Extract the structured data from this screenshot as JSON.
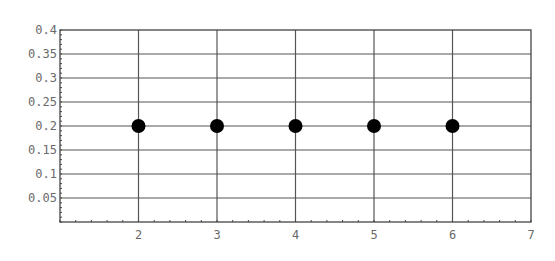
{
  "chart_data": {
    "type": "scatter",
    "title": "",
    "xlabel": "",
    "ylabel": "",
    "xlim": [
      1,
      7
    ],
    "ylim": [
      0,
      0.4
    ],
    "grid": true,
    "legend": null,
    "x_ticks": [
      2,
      3,
      4,
      5,
      6,
      7
    ],
    "x_tick_labels": [
      "2",
      "3",
      "4",
      "5",
      "6",
      "7"
    ],
    "y_ticks": [
      0.05,
      0.1,
      0.15,
      0.2,
      0.25,
      0.3,
      0.35,
      0.4
    ],
    "y_tick_labels": [
      "0.05",
      "0.1",
      "0.15",
      "0.2",
      "0.25",
      "0.3",
      "0.35",
      "0.4"
    ],
    "series": [
      {
        "name": "points",
        "x": [
          2,
          3,
          4,
          5,
          6
        ],
        "y": [
          0.2,
          0.2,
          0.2,
          0.2,
          0.2
        ],
        "color": "#000000"
      }
    ]
  },
  "style": {
    "axis_color": "#444444",
    "grid_color": "#555555",
    "label_color": "#6a6a6a",
    "point_color": "#000000"
  }
}
